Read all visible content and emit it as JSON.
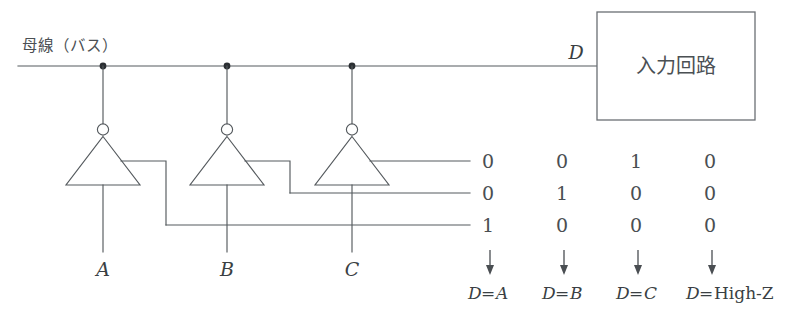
{
  "diagram": {
    "bus_label": "母線（バス）",
    "bus_output_label": "D",
    "input_circuit_box_label": "入力回路",
    "gates": [
      {
        "id": "gate-a",
        "input_label": "A",
        "type": "inverter-tristate"
      },
      {
        "id": "gate-b",
        "input_label": "B",
        "type": "inverter-tristate"
      },
      {
        "id": "gate-c",
        "input_label": "C",
        "type": "inverter-tristate"
      }
    ],
    "enable_table": {
      "columns": 4,
      "rows": [
        {
          "row_label": "enable-line-1",
          "values": [
            "0",
            "0",
            "1",
            "0"
          ]
        },
        {
          "row_label": "enable-line-2",
          "values": [
            "0",
            "1",
            "0",
            "0"
          ]
        },
        {
          "row_label": "enable-line-3",
          "values": [
            "1",
            "0",
            "0",
            "0"
          ]
        }
      ]
    },
    "results": [
      {
        "lhs": "D",
        "eq": "=",
        "rhs": "A",
        "rhs_style": "italic"
      },
      {
        "lhs": "D",
        "eq": "=",
        "rhs": "B",
        "rhs_style": "italic"
      },
      {
        "lhs": "D",
        "eq": "=",
        "rhs": "C",
        "rhs_style": "italic"
      },
      {
        "lhs": "D",
        "eq": "=",
        "rhs": "High-Z",
        "rhs_style": "roman"
      }
    ],
    "colors": {
      "wire": "#555a5e",
      "text": "#3a3f43",
      "junction": "#2b2f33",
      "background": "#ffffff"
    }
  }
}
